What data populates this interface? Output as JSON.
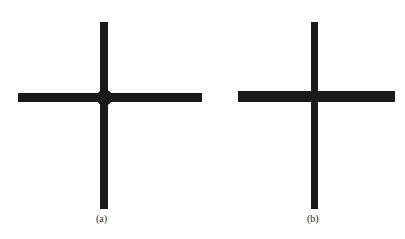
{
  "figure": {
    "panels": [
      {
        "id": "a",
        "caption": "(a)",
        "description": "Cross with circular joint at intersection"
      },
      {
        "id": "b",
        "caption": "(b)",
        "description": "Cross without joint at intersection"
      }
    ],
    "colors": {
      "stroke": "#1a1a1a",
      "background": "#ffffff"
    }
  }
}
